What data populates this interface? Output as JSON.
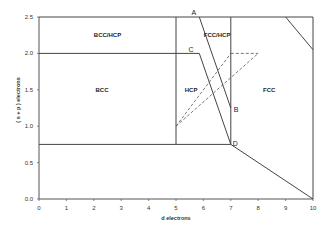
{
  "chart_data": {
    "type": "diagram",
    "title": "",
    "xlabel": "d electrons",
    "ylabel": "( s + p ) electrons",
    "xlim": [
      0,
      10
    ],
    "ylim": [
      0,
      2.5
    ],
    "x_ticks": [
      "0",
      "1",
      "2",
      "3",
      "4",
      "5",
      "6",
      "7",
      "8",
      "9",
      "10"
    ],
    "y_ticks": [
      "0.0",
      "0.5",
      "1.0",
      "1.5",
      "2.0",
      "2.5"
    ],
    "grid": false,
    "regions": [
      {
        "label": "BCC/HCP",
        "x": 2.5,
        "y": 2.25
      },
      {
        "label": "BCC",
        "x": 2.3,
        "y": 1.5
      },
      {
        "label": "HCP",
        "x": 5.55,
        "y": 1.5
      },
      {
        "label": "FCC/HCP",
        "x": 6.5,
        "y": 2.25
      },
      {
        "label": "FCC",
        "x": 8.4,
        "y": 1.5
      }
    ],
    "points": [
      {
        "label": "A",
        "x": 5.85,
        "y": 2.5
      },
      {
        "label": "B",
        "x": 7.0,
        "y": 1.25
      },
      {
        "label": "C",
        "x": 5.75,
        "y": 2.0
      },
      {
        "label": "D",
        "x": 7.0,
        "y": 0.75
      }
    ],
    "solid_lines": [
      {
        "from": [
          0,
          2.5
        ],
        "to": [
          10,
          2.5
        ]
      },
      {
        "from": [
          10,
          2.5
        ],
        "to": [
          10,
          0
        ]
      },
      {
        "from": [
          0,
          2.0
        ],
        "to": [
          5.85,
          2.0
        ]
      },
      {
        "from": [
          0,
          0.75
        ],
        "to": [
          7.0,
          0.75
        ]
      },
      {
        "from": [
          5,
          2.5
        ],
        "to": [
          5,
          0.75
        ]
      },
      {
        "from": [
          7,
          2.5
        ],
        "to": [
          7,
          0.75
        ]
      },
      {
        "from": [
          5.85,
          2.5
        ],
        "to": [
          7.0,
          1.25
        ]
      },
      {
        "from": [
          5.85,
          2.0
        ],
        "to": [
          7.0,
          0.75
        ]
      },
      {
        "from": [
          7.0,
          0.75
        ],
        "to": [
          10,
          0
        ]
      },
      {
        "from": [
          9.0,
          2.5
        ],
        "to": [
          10,
          2.05
        ]
      }
    ],
    "dashed_lines": [
      {
        "from": [
          5,
          1.0
        ],
        "to": [
          7.0,
          2.0
        ]
      },
      {
        "from": [
          5,
          1.0
        ],
        "to": [
          8.0,
          2.0
        ]
      },
      {
        "from": [
          7.0,
          2.0
        ],
        "to": [
          8.0,
          2.0
        ]
      }
    ]
  }
}
